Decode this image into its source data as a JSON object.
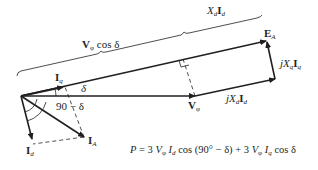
{
  "diagram": {
    "colors": {
      "line": "#231f20",
      "background": "#ffffff"
    },
    "labels": {
      "vphi_cos_delta": {
        "main": "V",
        "sub": "φ",
        "rest": " cos δ"
      },
      "xd_id": {
        "x": "X",
        "xsub": "d",
        "i": "I",
        "isub": "d"
      },
      "ea": {
        "main": "E",
        "sub": "A"
      },
      "jxq_iq": {
        "j": "j",
        "x": "X",
        "xsub": "q",
        "i": "I",
        "isub": "q"
      },
      "jxd_id": {
        "j": "j",
        "x": "X",
        "xsub": "d",
        "i": "I",
        "isub": "d"
      },
      "vphi": {
        "main": "V",
        "sub": "φ"
      },
      "iq": {
        "main": "I",
        "sub": "q"
      },
      "delta": "δ",
      "ninety_minus_delta": "90 − δ",
      "ia": {
        "main": "I",
        "sub": "A"
      },
      "id": {
        "main": "I",
        "sub": "d"
      }
    },
    "equation": "P = 3 Vφ Id cos (90° − δ) + 3 Vφ Iq cos δ",
    "equation_parts": {
      "p": "P",
      "eq1": " = 3 ",
      "v1": "V",
      "v1sub": "φ",
      "i1": " I",
      "i1sub": "d",
      "mid": " cos (90° − δ) + 3 ",
      "v2": "V",
      "v2sub": "φ",
      "i2": " I",
      "i2sub": "q",
      "end": " cos δ"
    }
  }
}
